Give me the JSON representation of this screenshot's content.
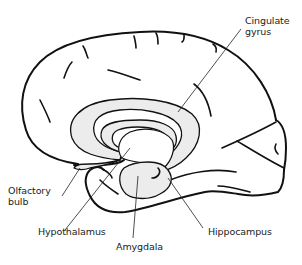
{
  "diagram": {
    "colors": {
      "outline": "#111111",
      "limbic_fill": "#ececec",
      "background": "#ffffff"
    },
    "labels": {
      "cingulate_gyrus_line1": "Cingulate",
      "cingulate_gyrus_line2": "gyrus",
      "olfactory_bulb_line1": "Olfactory",
      "olfactory_bulb_line2": "bulb",
      "hypothalamus": "Hypothalamus",
      "amygdala": "Amygdala",
      "hippocampus": "Hippocampus"
    }
  }
}
